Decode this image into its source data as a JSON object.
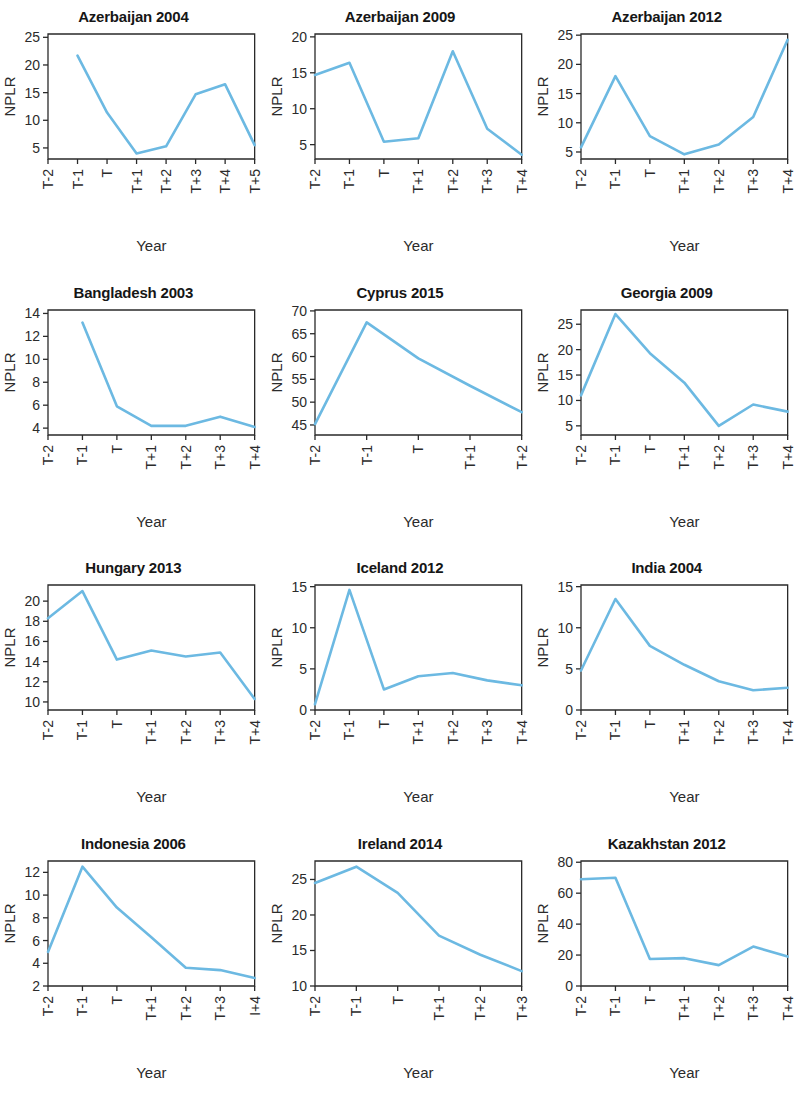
{
  "figure": {
    "kind": "small-multiples-line-grid",
    "columns": 3,
    "rows": 4,
    "background_color": "#ffffff",
    "line_color": "#6cb9e2",
    "axis_color": "#2a2a2a",
    "title_color": "#161616",
    "shared_xlabel": "Year",
    "shared_ylabel": "NPLR"
  },
  "chart_data": [
    {
      "type": "line",
      "title": "Azerbaijan 2004",
      "xlabel": "Year",
      "ylabel": "NPLR",
      "categories": [
        "T-2",
        "T-1",
        "T",
        "T+1",
        "T+2",
        "T+3",
        "T+4",
        "T+5"
      ],
      "values": [
        null,
        21.7,
        11.4,
        4.0,
        5.3,
        14.7,
        16.5,
        5.5
      ],
      "yticks": [
        5,
        10,
        15,
        20,
        25
      ],
      "ylim": [
        3.0,
        25.6
      ],
      "grid": false,
      "legend": null
    },
    {
      "type": "line",
      "title": "Azerbaijan 2009",
      "xlabel": "Year",
      "ylabel": "NPLR",
      "categories": [
        "T-2",
        "T-1",
        "T",
        "T+1",
        "T+2",
        "T+3",
        "T+4"
      ],
      "values": [
        14.7,
        16.4,
        5.4,
        5.9,
        18.0,
        7.2,
        3.6
      ],
      "yticks": [
        5,
        10,
        15,
        20
      ],
      "ylim": [
        3.0,
        20.4
      ],
      "grid": false,
      "legend": null
    },
    {
      "type": "line",
      "title": "Azerbaijan 2012",
      "xlabel": "Year",
      "ylabel": "NPLR",
      "categories": [
        "T-2",
        "T-1",
        "T",
        "T+1",
        "T+2",
        "T+3",
        "T+4"
      ],
      "values": [
        5.8,
        18.0,
        7.7,
        4.6,
        6.3,
        11.0,
        24.2
      ],
      "yticks": [
        5,
        10,
        15,
        20,
        25
      ],
      "ylim": [
        3.8,
        25.2
      ],
      "grid": false,
      "legend": null
    },
    {
      "type": "line",
      "title": "Bangladesh 2003",
      "xlabel": "Year",
      "ylabel": "NPLR",
      "categories": [
        "T-2",
        "T-1",
        "T",
        "T+1",
        "T+2",
        "T+3",
        "T+4"
      ],
      "values": [
        null,
        13.2,
        5.9,
        4.2,
        4.2,
        5.0,
        4.1
      ],
      "yticks": [
        4,
        6,
        8,
        10,
        12,
        14
      ],
      "ylim": [
        3.4,
        14.3
      ],
      "grid": false,
      "legend": null
    },
    {
      "type": "line",
      "title": "Cyprus 2015",
      "xlabel": "Year",
      "ylabel": "NPLR",
      "categories": [
        "T-2",
        "T-1",
        "T",
        "T+1",
        "T+2"
      ],
      "values": [
        45.2,
        67.5,
        59.6,
        53.6,
        47.8
      ],
      "yticks": [
        45,
        50,
        55,
        60,
        65,
        70
      ],
      "ylim": [
        42.8,
        70.2
      ],
      "grid": false,
      "legend": null
    },
    {
      "type": "line",
      "title": "Georgia 2009",
      "xlabel": "Year",
      "ylabel": "NPLR",
      "categories": [
        "T-2",
        "T-1",
        "T",
        "T+1",
        "T+2",
        "T+3",
        "T+4"
      ],
      "values": [
        11.0,
        27.0,
        19.3,
        13.5,
        5.0,
        9.2,
        7.8
      ],
      "yticks": [
        5,
        10,
        15,
        20,
        25
      ],
      "ylim": [
        3.2,
        27.8
      ],
      "grid": false,
      "legend": null
    },
    {
      "type": "line",
      "title": "Hungary 2013",
      "xlabel": "Year",
      "ylabel": "NPLR",
      "categories": [
        "T-2",
        "T-1",
        "T",
        "T+1",
        "T+2",
        "T+3",
        "T+4"
      ],
      "values": [
        18.3,
        21.0,
        14.2,
        15.1,
        14.5,
        14.9,
        10.3
      ],
      "yticks": [
        10,
        12,
        14,
        16,
        18,
        20
      ],
      "ylim": [
        9.2,
        21.6
      ],
      "grid": false,
      "legend": null
    },
    {
      "type": "line",
      "title": "Iceland 2012",
      "xlabel": "Year",
      "ylabel": "NPLR",
      "categories": [
        "T-2",
        "T-1",
        "T",
        "T+1",
        "T+2",
        "T+3",
        "T+4"
      ],
      "values": [
        0.7,
        14.6,
        2.5,
        4.1,
        4.5,
        3.6,
        3.0
      ],
      "yticks": [
        0,
        5,
        10,
        15
      ],
      "ylim": [
        0.0,
        15.2
      ],
      "grid": false,
      "legend": null
    },
    {
      "type": "line",
      "title": "India 2004",
      "xlabel": "Year",
      "ylabel": "NPLR",
      "categories": [
        "T-2",
        "T-1",
        "T",
        "T+1",
        "T+2",
        "T+3",
        "T+4"
      ],
      "values": [
        4.8,
        13.5,
        7.8,
        5.5,
        3.5,
        2.4,
        2.7
      ],
      "yticks": [
        0,
        5,
        10,
        15
      ],
      "ylim": [
        0.0,
        15.2
      ],
      "grid": false,
      "legend": null
    },
    {
      "type": "line",
      "title": "Indonesia 2006",
      "xlabel": "Year",
      "ylabel": "NPLR",
      "categories": [
        "T-2",
        "T-1",
        "T",
        "T+1",
        "T+2",
        "T+3",
        "I+4"
      ],
      "values": [
        5.0,
        12.5,
        8.9,
        6.3,
        3.6,
        3.4,
        2.7
      ],
      "yticks": [
        2,
        4,
        6,
        8,
        10,
        12
      ],
      "ylim": [
        2.0,
        13.0
      ],
      "grid": false,
      "legend": null
    },
    {
      "type": "line",
      "title": "Ireland 2014",
      "xlabel": "Year",
      "ylabel": "NPLR",
      "categories": [
        "T-2",
        "T-1",
        "T",
        "T+1",
        "T+2",
        "T+3"
      ],
      "values": [
        24.5,
        26.8,
        23.1,
        17.1,
        14.4,
        12.1
      ],
      "yticks": [
        10,
        15,
        20,
        25
      ],
      "ylim": [
        10.0,
        27.6
      ],
      "grid": false,
      "legend": null
    },
    {
      "type": "line",
      "title": "Kazakhstan 2012",
      "xlabel": "Year",
      "ylabel": "NPLR",
      "categories": [
        "T-2",
        "T-1",
        "T",
        "T+1",
        "T+2",
        "T+3",
        "T+4"
      ],
      "values": [
        69.0,
        70.0,
        17.5,
        18.0,
        13.5,
        25.5,
        19.0
      ],
      "yticks": [
        0,
        20,
        40,
        60,
        80
      ],
      "ylim": [
        0.0,
        80.8
      ],
      "grid": false,
      "legend": null
    }
  ]
}
